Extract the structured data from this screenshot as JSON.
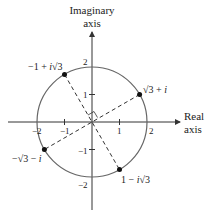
{
  "diagram": {
    "axis_labels": {
      "imag_line1": "Imaginary",
      "imag_line2": "axis",
      "real_line1": "Real",
      "real_line2": "axis"
    },
    "ticks": {
      "x": [
        "−2",
        "−1",
        "1",
        "2"
      ],
      "y": [
        "2",
        "1",
        "−1",
        "−2"
      ]
    },
    "points": [
      {
        "label_main": "√3 + ",
        "label_i": "i"
      },
      {
        "label_pre": "−1 + ",
        "label_i": "i",
        "label_post": "√3"
      },
      {
        "label_main": "−√3 − ",
        "label_i": "i"
      },
      {
        "label_pre": "1 − ",
        "label_i": "i",
        "label_post": "√3"
      }
    ],
    "colors": {
      "line": "#333333",
      "circle": "#666666",
      "point": "#111111"
    }
  }
}
